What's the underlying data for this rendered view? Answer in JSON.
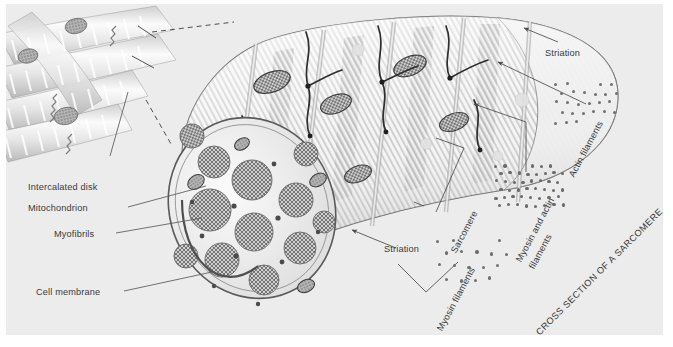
{
  "figure": {
    "background_color": "#ececec",
    "page_color": "#ffffff",
    "text_color": "#3a3a3a"
  },
  "labels": {
    "intercalated_disk": "Intercalated disk",
    "mitochondrion": "Mitochondrion",
    "myofibrils": "Myofibrils",
    "cell_membrane": "Cell membrane",
    "striation_top": "Striation",
    "striation_bottom": "Striation",
    "sarcomere": "Sarcomere",
    "actin_filaments": "Actin filaments",
    "myosin_and_actin_filaments_line1": "Myosin and actin",
    "myosin_and_actin_filaments_line2": "filaments",
    "myosin_filaments": "Myosin filaments",
    "cross_section_caption": "CROSS SECTION OF A SARCOMERE"
  },
  "clusters": {
    "actin": {
      "name": "actin-filament-cluster",
      "dot_count": 25,
      "dot_size": 3,
      "spacing": 11,
      "color": "#6f6f6f"
    },
    "myosin_actin": {
      "name": "myosin-actin-filament-cluster",
      "dot_count": 45,
      "dot_size": 3.4,
      "spacing": 9,
      "color": "#6a6a6a"
    },
    "myosin": {
      "name": "myosin-filament-cluster",
      "dot_count": 17,
      "dot_size": 3.4,
      "spacing": 15,
      "color": "#6f6f6f"
    }
  },
  "colors": {
    "cell_fill": "#f4f4f4",
    "cell_outline": "#6d6d6d",
    "striation_light": "#d9d9d9",
    "striation_dark": "#b4b4b4",
    "myofibril_fill": "#c9c9c9",
    "myofibril_edge": "#6e6e6e",
    "mitochondrion_fill": "#9a9a9a",
    "fiber_light": "#efefef",
    "fiber_shade": "#c4c4c4",
    "leader_line": "#59595f"
  }
}
